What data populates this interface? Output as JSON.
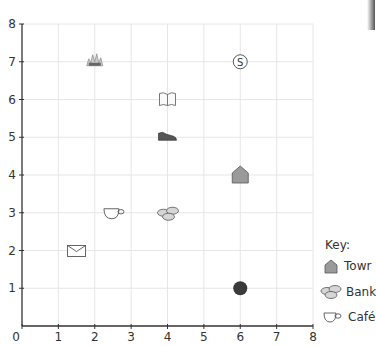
{
  "chart_data": {
    "type": "scatter",
    "title": "",
    "xlabel": "",
    "ylabel": "",
    "xlim": [
      0,
      8
    ],
    "ylim": [
      0,
      8
    ],
    "grid": true,
    "x_ticks": [
      "0",
      "1",
      "2",
      "3",
      "4",
      "5",
      "6",
      "7",
      "8"
    ],
    "y_ticks": [
      "1",
      "2",
      "3",
      "4",
      "5",
      "6",
      "7",
      "8"
    ],
    "points": [
      {
        "name": "fire-station",
        "icon": "flame-icon",
        "x": 2,
        "y": 7
      },
      {
        "name": "swimming-pool",
        "icon": "s-circle-icon",
        "x": 6,
        "y": 7
      },
      {
        "name": "library",
        "icon": "book-icon",
        "x": 4,
        "y": 6
      },
      {
        "name": "shoe-shop",
        "icon": "shoe-icon",
        "x": 4,
        "y": 5
      },
      {
        "name": "Town Hall",
        "icon": "house-icon",
        "x": 6,
        "y": 4
      },
      {
        "name": "Café",
        "icon": "cup-icon",
        "x": 2.5,
        "y": 3
      },
      {
        "name": "Bank",
        "icon": "coins-icon",
        "x": 4,
        "y": 3
      },
      {
        "name": "post-office",
        "icon": "envelope-icon",
        "x": 1.5,
        "y": 2
      },
      {
        "name": "dark-circle",
        "icon": "filled-circle-icon",
        "x": 6,
        "y": 1
      }
    ],
    "legend": {
      "title": "Key:",
      "position": "right",
      "entries": [
        {
          "icon": "house-icon",
          "label": "Towr"
        },
        {
          "icon": "coins-icon",
          "label": "Bank"
        },
        {
          "icon": "cup-icon",
          "label": "Café"
        }
      ]
    }
  },
  "axis": {
    "origin_label": "0",
    "pool_letter": "S"
  },
  "colors": {
    "grid": "#e6e6e6",
    "axis": "#333333",
    "house": "#9a9a9a",
    "coins": "#d6d6d6",
    "dark": "#3a3a3a"
  }
}
